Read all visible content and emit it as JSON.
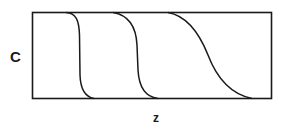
{
  "diagram": {
    "y_axis_label": "C",
    "x_axis_label": "z",
    "frame": {
      "x": 32,
      "y": 12,
      "width": 239,
      "height": 86
    },
    "curves": [
      {
        "name": "front-1",
        "top_x": 66,
        "bottom_x": 94,
        "steepness": "very steep"
      },
      {
        "name": "front-2",
        "top_x": 113,
        "bottom_x": 158,
        "steepness": "steep"
      },
      {
        "name": "front-3",
        "top_x": 168,
        "bottom_x": 252,
        "steepness": "gradual"
      }
    ],
    "line_color": "#1a1a1a"
  }
}
